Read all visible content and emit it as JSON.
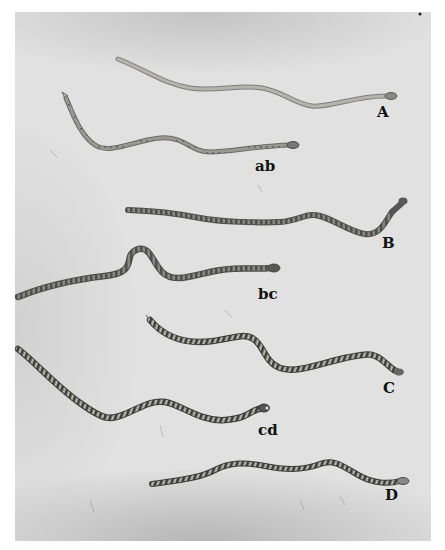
{
  "plate": {
    "background_color": "#e1e1e1",
    "snake_color_light": "#a8a8a0",
    "snake_color_dark": "#5a5a55",
    "specimens": [
      {
        "id": "A",
        "label": "A",
        "label_pos": [
          377,
          105
        ],
        "pattern": "plain"
      },
      {
        "id": "ab",
        "label": "ab",
        "label_pos": [
          255,
          159
        ],
        "pattern": "faint-spots"
      },
      {
        "id": "B",
        "label": "B",
        "label_pos": [
          382,
          236
        ],
        "pattern": "blotched"
      },
      {
        "id": "bc",
        "label": "bc",
        "label_pos": [
          258,
          287
        ],
        "pattern": "blotched"
      },
      {
        "id": "C",
        "label": "C",
        "label_pos": [
          383,
          381
        ],
        "pattern": "banded"
      },
      {
        "id": "cd",
        "label": "cd",
        "label_pos": [
          258,
          423
        ],
        "pattern": "banded"
      },
      {
        "id": "D",
        "label": "D",
        "label_pos": [
          385,
          488
        ],
        "pattern": "banded"
      }
    ]
  }
}
